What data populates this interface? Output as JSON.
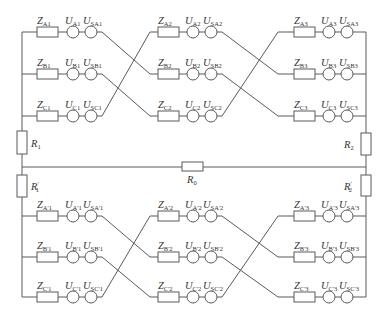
{
  "diagram": {
    "type": "circuit",
    "title": "",
    "colors": {
      "line": "#5a5a5a",
      "text": "#333333",
      "background": "#ffffff"
    },
    "rows_y": {
      "upper": [
        32,
        74,
        116
      ],
      "lower": [
        216,
        257,
        297
      ]
    },
    "segments_x": [
      {
        "z": 37,
        "u": 73,
        "us": 91,
        "start": 22,
        "end": 102
      },
      {
        "z": 158,
        "u": 193,
        "us": 211,
        "start": 150,
        "end": 222
      },
      {
        "z": 294,
        "u": 329,
        "us": 347,
        "start": 278,
        "end": 366
      }
    ],
    "upper_line": {
      "segments": [
        {
          "rows": [
            {
              "z": "Z",
              "z_sub": "A1",
              "u": "U",
              "u_sub": "A1",
              "us": "U",
              "us_sub": "SA1"
            },
            {
              "z": "Z",
              "z_sub": "B1",
              "u": "U",
              "u_sub": "B1",
              "us": "U",
              "us_sub": "SB1"
            },
            {
              "z": "Z",
              "z_sub": "C1",
              "u": "U",
              "u_sub": "C1",
              "us": "U",
              "us_sub": "SC1"
            }
          ]
        },
        {
          "rows": [
            {
              "z": "Z",
              "z_sub": "A2",
              "u": "U",
              "u_sub": "A2",
              "us": "U",
              "us_sub": "SA2"
            },
            {
              "z": "Z",
              "z_sub": "B2",
              "u": "U",
              "u_sub": "B2",
              "us": "U",
              "us_sub": "SB2"
            },
            {
              "z": "Z",
              "z_sub": "C2",
              "u": "U",
              "u_sub": "C2",
              "us": "U",
              "us_sub": "SC2"
            }
          ]
        },
        {
          "rows": [
            {
              "z": "Z",
              "z_sub": "A3",
              "u": "U",
              "u_sub": "A3",
              "us": "U",
              "us_sub": "SA3"
            },
            {
              "z": "Z",
              "z_sub": "B3",
              "u": "U",
              "u_sub": "B3",
              "us": "U",
              "us_sub": "SB3"
            },
            {
              "z": "Z",
              "z_sub": "C3",
              "u": "U",
              "u_sub": "C3",
              "us": "U",
              "us_sub": "SC3"
            }
          ]
        }
      ]
    },
    "lower_line": {
      "segments": [
        {
          "rows": [
            {
              "z": "Z",
              "z_sub": "A'1",
              "u": "U",
              "u_sub": "A'1",
              "us": "U",
              "us_sub": "SA'1"
            },
            {
              "z": "Z",
              "z_sub": "B'1",
              "u": "U",
              "u_sub": "B'1",
              "us": "U",
              "us_sub": "SB'1"
            },
            {
              "z": "Z",
              "z_sub": "C'1",
              "u": "U",
              "u_sub": "C'1",
              "us": "U",
              "us_sub": "SC'1"
            }
          ]
        },
        {
          "rows": [
            {
              "z": "Z",
              "z_sub": "A'2",
              "u": "U",
              "u_sub": "A'2",
              "us": "U",
              "us_sub": "SA'2"
            },
            {
              "z": "Z",
              "z_sub": "B'2",
              "u": "U",
              "u_sub": "B'2",
              "us": "U",
              "us_sub": "SB'2"
            },
            {
              "z": "Z",
              "z_sub": "C'2",
              "u": "U",
              "u_sub": "C'2",
              "us": "U",
              "us_sub": "SC'2"
            }
          ]
        },
        {
          "rows": [
            {
              "z": "Z",
              "z_sub": "A'3",
              "u": "U",
              "u_sub": "A'3",
              "us": "U",
              "us_sub": "SA'3"
            },
            {
              "z": "Z",
              "z_sub": "B'3",
              "u": "U",
              "u_sub": "B'3",
              "us": "U",
              "us_sub": "SB'3"
            },
            {
              "z": "Z",
              "z_sub": "C'3",
              "u": "U",
              "u_sub": "C'3",
              "us": "U",
              "us_sub": "SC'3"
            }
          ]
        }
      ]
    },
    "transposition": "row A -> row B, row B -> row C, row C -> row A (between each segment)",
    "resistors": {
      "r1": {
        "label": "R",
        "sub": "1",
        "prime": ""
      },
      "r2": {
        "label": "R",
        "sub": "2",
        "prime": ""
      },
      "r1p": {
        "label": "R",
        "sub": "1",
        "prime": "′"
      },
      "r2p": {
        "label": "R",
        "sub": "2",
        "prime": "′"
      },
      "r0": {
        "label": "R",
        "sub": "0",
        "prime": ""
      }
    }
  }
}
